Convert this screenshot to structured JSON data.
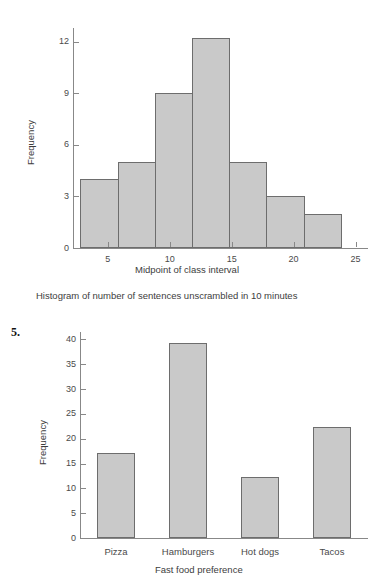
{
  "page": {
    "background_color": "#ffffff",
    "item_number": "5."
  },
  "histogram_caption": "Histogram of number of sentences unscrambled in 10 minutes",
  "chart_data": [
    {
      "type": "bar",
      "title": "",
      "subtitle": "Histogram of number of sentences unscrambled in 10 minutes",
      "xlabel": "Midpoint of class interval",
      "ylabel": "Frequency",
      "xlim": [
        2.2,
        26.0
      ],
      "ylim": [
        0,
        12.8
      ],
      "grid": false,
      "legend": "none",
      "bar_fill_color": "#c9c9c9",
      "bar_border_color": "#6d6d6d",
      "axis_color": "#888888",
      "x_ticks": [
        5,
        10,
        15,
        20,
        25
      ],
      "x_tick_labels": [
        "5",
        "10",
        "15",
        "20",
        "25"
      ],
      "y_ticks": [
        0,
        3,
        6,
        9,
        12
      ],
      "y_tick_labels": [
        "0",
        "3",
        "6",
        "9",
        "12"
      ],
      "bin_edges": [
        2.8,
        5.8,
        8.8,
        11.8,
        14.8,
        17.8,
        20.8,
        23.8
      ],
      "bin_midpoints": [
        4.3,
        7.3,
        10.3,
        13.3,
        16.3,
        19.3,
        22.3
      ],
      "values": [
        4,
        5,
        9,
        12.2,
        5,
        3,
        2
      ],
      "categories": [
        "2.8-5.8",
        "5.8-8.8",
        "8.8-11.8",
        "11.8-14.8",
        "14.8-17.8",
        "17.8-20.8",
        "20.8-23.8"
      ]
    },
    {
      "type": "bar",
      "title": "",
      "subtitle": "",
      "xlabel": "Fast food preference",
      "ylabel": "Frequency",
      "xlim": [
        0,
        4
      ],
      "ylim": [
        0,
        41.5
      ],
      "grid": false,
      "legend": "none",
      "bar_fill_color": "#c9c9c9",
      "bar_border_color": "#6d6d6d",
      "axis_color": "#888888",
      "x_ticks": [],
      "x_tick_labels": [],
      "y_ticks": [
        0,
        5,
        10,
        15,
        20,
        25,
        30,
        35,
        40
      ],
      "y_tick_labels": [
        "0",
        "5",
        "10",
        "15",
        "20",
        "25",
        "30",
        "35",
        "40"
      ],
      "categories": [
        "Pizza",
        "Hamburgers",
        "Hot dogs",
        "Tacos"
      ],
      "values": [
        17.2,
        39.2,
        12.2,
        22.4
      ]
    }
  ]
}
